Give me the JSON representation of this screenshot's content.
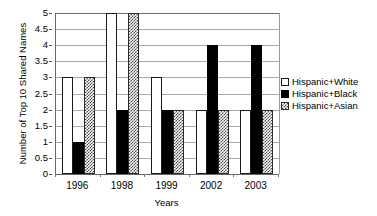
{
  "chart_data": {
    "type": "bar",
    "title": "",
    "xlabel": "Years",
    "ylabel": "Number of Top 10 Shared Names",
    "categories": [
      "1996",
      "1998",
      "1999",
      "2002",
      "2003"
    ],
    "series": [
      {
        "name": "Hispanic+White",
        "values": [
          3,
          5,
          3,
          2,
          2
        ],
        "swatch": "white"
      },
      {
        "name": "Hispanic+Black",
        "values": [
          1,
          2,
          2,
          4,
          4
        ],
        "swatch": "black"
      },
      {
        "name": "Hispanic+Asian",
        "values": [
          3,
          5,
          2,
          2,
          2
        ],
        "swatch": "asian"
      }
    ],
    "ylim": [
      0,
      5
    ],
    "y_ticks": [
      "0",
      "0.5",
      "1",
      "1.5",
      "2",
      "2.5",
      "3",
      "3.5",
      "4",
      "4.5",
      "5"
    ],
    "y_tick_values": [
      0,
      0.5,
      1,
      1.5,
      2,
      2.5,
      3,
      3.5,
      4,
      4.5,
      5
    ],
    "grid": true,
    "legend_position": "right",
    "colors": {
      "series_white": "#ffffff",
      "series_black": "#000000",
      "series_asian": "#4a4a4a",
      "axis": "#666666",
      "gridline": "#a9a9a9",
      "text": "#000000",
      "background": "#ffffff"
    }
  },
  "legend": {
    "entries": [
      {
        "label": "Hispanic+White"
      },
      {
        "label": "Hispanic+Black"
      },
      {
        "label": "Hispanic+Asian"
      }
    ]
  }
}
